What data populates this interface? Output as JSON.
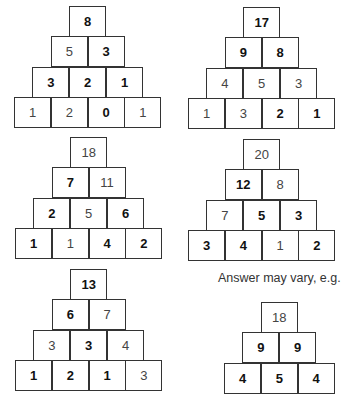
{
  "pyramids": [
    {
      "id": "p1",
      "rows": [
        [
          {
            "v": "8",
            "bold": true
          }
        ],
        [
          {
            "v": "5",
            "bold": false
          },
          {
            "v": "3",
            "bold": true
          }
        ],
        [
          {
            "v": "3",
            "bold": true
          },
          {
            "v": "2",
            "bold": true
          },
          {
            "v": "1",
            "bold": true
          }
        ],
        [
          {
            "v": "1",
            "bold": false
          },
          {
            "v": "2",
            "bold": false
          },
          {
            "v": "0",
            "bold": true
          },
          {
            "v": "1",
            "bold": false
          }
        ]
      ]
    },
    {
      "id": "p2",
      "rows": [
        [
          {
            "v": "17",
            "bold": true
          }
        ],
        [
          {
            "v": "9",
            "bold": true
          },
          {
            "v": "8",
            "bold": true
          }
        ],
        [
          {
            "v": "4",
            "bold": false
          },
          {
            "v": "5",
            "bold": false
          },
          {
            "v": "3",
            "bold": false
          }
        ],
        [
          {
            "v": "1",
            "bold": false
          },
          {
            "v": "3",
            "bold": false
          },
          {
            "v": "2",
            "bold": true
          },
          {
            "v": "1",
            "bold": true
          }
        ]
      ]
    },
    {
      "id": "p3",
      "rows": [
        [
          {
            "v": "18",
            "bold": false
          }
        ],
        [
          {
            "v": "7",
            "bold": true
          },
          {
            "v": "11",
            "bold": false
          }
        ],
        [
          {
            "v": "2",
            "bold": true
          },
          {
            "v": "5",
            "bold": false
          },
          {
            "v": "6",
            "bold": true
          }
        ],
        [
          {
            "v": "1",
            "bold": true
          },
          {
            "v": "1",
            "bold": false
          },
          {
            "v": "4",
            "bold": true
          },
          {
            "v": "2",
            "bold": true
          }
        ]
      ]
    },
    {
      "id": "p4",
      "rows": [
        [
          {
            "v": "20",
            "bold": false
          }
        ],
        [
          {
            "v": "12",
            "bold": true
          },
          {
            "v": "8",
            "bold": false
          }
        ],
        [
          {
            "v": "7",
            "bold": false
          },
          {
            "v": "5",
            "bold": true
          },
          {
            "v": "3",
            "bold": true
          }
        ],
        [
          {
            "v": "3",
            "bold": true
          },
          {
            "v": "4",
            "bold": true
          },
          {
            "v": "1",
            "bold": false
          },
          {
            "v": "2",
            "bold": true
          }
        ]
      ]
    },
    {
      "id": "p5",
      "rows": [
        [
          {
            "v": "13",
            "bold": true
          }
        ],
        [
          {
            "v": "6",
            "bold": true
          },
          {
            "v": "7",
            "bold": false
          }
        ],
        [
          {
            "v": "3",
            "bold": false
          },
          {
            "v": "3",
            "bold": true
          },
          {
            "v": "4",
            "bold": false
          }
        ],
        [
          {
            "v": "1",
            "bold": true
          },
          {
            "v": "2",
            "bold": true
          },
          {
            "v": "1",
            "bold": true
          },
          {
            "v": "3",
            "bold": false
          }
        ]
      ]
    },
    {
      "id": "p6",
      "rows": [
        [
          {
            "v": "18",
            "bold": false
          }
        ],
        [
          {
            "v": "9",
            "bold": true
          },
          {
            "v": "9",
            "bold": true
          }
        ],
        [
          {
            "v": "4",
            "bold": true
          },
          {
            "v": "5",
            "bold": true
          },
          {
            "v": "4",
            "bold": true
          }
        ]
      ]
    }
  ],
  "note": "Answer may vary, e.g."
}
